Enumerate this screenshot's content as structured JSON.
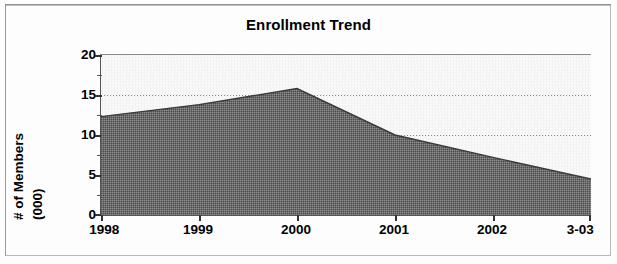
{
  "chart_data": {
    "type": "area",
    "title": "Enrollment Trend",
    "xlabel": "",
    "ylabel": "# of Members (000)",
    "ylabel_lines": [
      "# of Members",
      "(000)"
    ],
    "categories": [
      "1998",
      "1999",
      "2000",
      "2001",
      "2002",
      "3-03"
    ],
    "values": [
      12.3,
      13.8,
      15.8,
      10.0,
      7.2,
      4.5
    ],
    "series": [
      {
        "name": "Enrollment",
        "values": [
          12.3,
          13.8,
          15.8,
          10.0,
          7.2,
          4.5
        ]
      }
    ],
    "ylim": [
      0,
      20
    ],
    "yticks": [
      0,
      5,
      10,
      15,
      20
    ],
    "ytick_labels": [
      "0",
      "5",
      "10",
      "15",
      "20"
    ],
    "yminor_ticks": [
      2.5,
      7.5,
      12.5,
      17.5
    ],
    "gridlines": [
      10,
      15
    ],
    "grid": true,
    "legend": false,
    "legend_position": "none",
    "fill_color": "#6e6e6e",
    "plot_background": "#f5f5f5",
    "axis_color": "#333333"
  },
  "axis": {
    "y_title_line1": "# of Members",
    "y_title_line2": "(000)"
  }
}
